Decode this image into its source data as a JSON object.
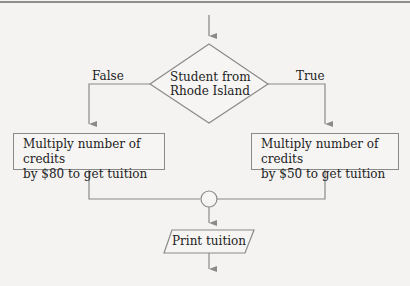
{
  "diagram": {
    "type": "flowchart",
    "decision": {
      "line1": "Student from",
      "line2": "Rhode Island"
    },
    "branches": {
      "false_label": "False",
      "true_label": "True"
    },
    "process_false": {
      "line1": "Multiply number of credits",
      "line2": "by $80 to get tuition"
    },
    "process_true": {
      "line1": "Multiply number of credits",
      "line2": "by $50 to get tuition"
    },
    "output": {
      "label": "Print tuition"
    },
    "colors": {
      "line": "#8a8a8a",
      "background": "#f4f3f1",
      "text": "#222222"
    }
  }
}
